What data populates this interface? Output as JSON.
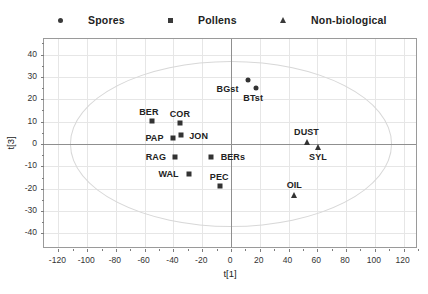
{
  "legend": {
    "entries": [
      {
        "label": "Spores",
        "marker": "circle-marker-icon",
        "x": 58,
        "label_x": 87
      },
      {
        "label": "Pollens",
        "marker": "square-marker-icon",
        "x": 168,
        "label_x": 196
      },
      {
        "label": "Non-biological",
        "marker": "triangle-marker-icon",
        "x": 280,
        "label_x": 308
      }
    ]
  },
  "footer_note": "",
  "chart_data": {
    "type": "scatter",
    "title": "",
    "xlabel": "t[1]",
    "ylabel": "t[3]",
    "xlim": [
      -130,
      130
    ],
    "ylim": [
      -47,
      47
    ],
    "xticks": [
      -120,
      -100,
      -80,
      -60,
      -40,
      -20,
      0,
      20,
      40,
      60,
      80,
      100,
      120
    ],
    "yticks": [
      -40,
      -30,
      -20,
      -10,
      0,
      10,
      20,
      30,
      40
    ],
    "grid": true,
    "legend_position": "top",
    "confidence_ellipse": {
      "center_x": 0,
      "center_y": 0,
      "radius_x": 112,
      "radius_y": 37
    },
    "series": [
      {
        "name": "Spores",
        "marker": "circle",
        "points": [
          {
            "label": "BGst",
            "x": 11.5,
            "y": 28.5,
            "label_dx": -20,
            "label_dy": 9
          },
          {
            "label": "BTst",
            "x": 17.5,
            "y": 25.0,
            "label_dx": -3,
            "label_dy": 10
          }
        ]
      },
      {
        "name": "Pollens",
        "marker": "square",
        "points": [
          {
            "label": "BER",
            "x": -55.0,
            "y": 10.5,
            "label_dx": -3,
            "label_dy": -9
          },
          {
            "label": "COR",
            "x": -35.5,
            "y": 9.5,
            "label_dx": 0,
            "label_dy": -9
          },
          {
            "label": "PAP",
            "x": -40.0,
            "y": 2.5,
            "label_dx": -19,
            "label_dy": 0
          },
          {
            "label": "JON",
            "x": -35.0,
            "y": 4.0,
            "label_dx": 18,
            "label_dy": 1
          },
          {
            "label": "RAG",
            "x": -39.0,
            "y": -6.0,
            "label_dx": -19,
            "label_dy": 0
          },
          {
            "label": "BERs",
            "x": -14.0,
            "y": -6.0,
            "label_dx": 22,
            "label_dy": 0
          },
          {
            "label": "WAL",
            "x": -29.5,
            "y": -13.5,
            "label_dx": -20,
            "label_dy": 0
          },
          {
            "label": "PEC",
            "x": -7.5,
            "y": -19.0,
            "label_dx": -1,
            "label_dy": -9
          }
        ]
      },
      {
        "name": "Non-biological",
        "marker": "triangle",
        "points": [
          {
            "label": "DUST",
            "x": 52.5,
            "y": 1.0,
            "label_dx": 0,
            "label_dy": -10
          },
          {
            "label": "SYL",
            "x": 60.5,
            "y": -1.5,
            "label_dx": 0,
            "label_dy": 10
          },
          {
            "label": "OIL",
            "x": 44.0,
            "y": -23.0,
            "label_dx": 0,
            "label_dy": -10
          }
        ]
      }
    ]
  }
}
